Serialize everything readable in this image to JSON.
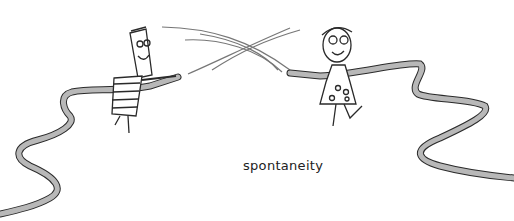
{
  "illustration": {
    "caption": "spontaneity",
    "colors": {
      "background": "#ffffff",
      "line": "#2a2a2a",
      "hose_fill": "#b8b8b8",
      "spray": "#555555"
    },
    "figures": [
      {
        "name": "striped-shirt-character",
        "holding": "hose"
      },
      {
        "name": "polka-dot-dress-character",
        "holding": "hose"
      }
    ]
  }
}
